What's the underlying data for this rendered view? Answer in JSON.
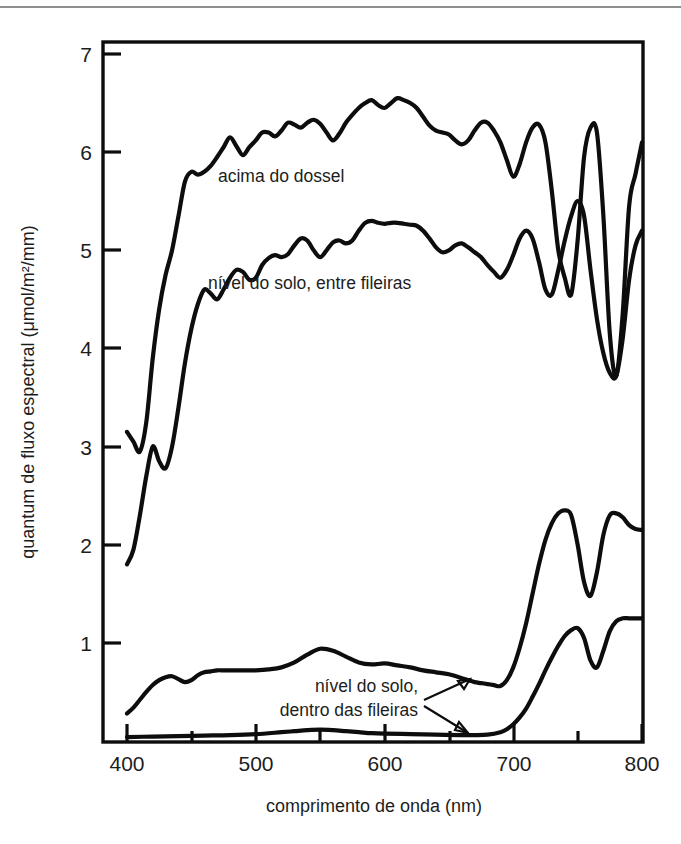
{
  "figure": {
    "divider_color": "#8f8f8f",
    "axes": {
      "x": {
        "label": "comprimento de onda (nm)",
        "ticks": [
          400,
          500,
          600,
          700,
          800
        ],
        "minor_ticks": [
          450,
          550,
          650,
          750
        ],
        "range": [
          395,
          805
        ],
        "unit": "nm"
      },
      "y": {
        "label": "quantum de fluxo espectral (μmol/m²/mm)",
        "label_plain": "quantum de fluxo espectral (umol/m2/mm)",
        "ticks": [
          1,
          2,
          3,
          4,
          5,
          6,
          7
        ],
        "range": [
          0,
          7.55
        ],
        "unit": "μmol/m²/mm"
      }
    },
    "annotations": [
      {
        "id": "acima-do-dossel",
        "text": "acima do dossel",
        "x": 218,
        "y": 182
      },
      {
        "id": "nivel-entre-fileiras",
        "text": "nível do solo, entre fileiras",
        "x": 208,
        "y": 289
      },
      {
        "id": "nivel-dentro-line1",
        "text": "nível do solo,",
        "x": 304,
        "y": 692
      },
      {
        "id": "nivel-dentro-line2",
        "text": "dentro das fileiras",
        "x": 262,
        "y": 716
      }
    ]
  },
  "chart_data": {
    "type": "line",
    "title": "",
    "xlabel": "comprimento de onda (nm)",
    "ylabel": "quantum de fluxo espectral (μmol/m²/mm)",
    "xlim": [
      395,
      805
    ],
    "ylim": [
      0,
      7.55
    ],
    "xticks": [
      400,
      500,
      600,
      700,
      800
    ],
    "yticks": [
      1,
      2,
      3,
      4,
      5,
      6,
      7
    ],
    "grid": false,
    "legend": "inline-annotations",
    "line_color": "#0d0d0d",
    "series": [
      {
        "name": "acima do dossel",
        "label_en": "above canopy",
        "x": [
          400,
          405,
          410,
          415,
          420,
          425,
          430,
          435,
          440,
          445,
          450,
          455,
          460,
          465,
          470,
          475,
          480,
          485,
          490,
          495,
          500,
          505,
          510,
          515,
          520,
          525,
          530,
          535,
          540,
          545,
          550,
          555,
          560,
          565,
          570,
          575,
          580,
          585,
          590,
          595,
          600,
          605,
          610,
          615,
          620,
          625,
          630,
          635,
          640,
          645,
          650,
          655,
          660,
          665,
          670,
          675,
          680,
          685,
          690,
          695,
          700,
          705,
          710,
          715,
          720,
          725,
          730,
          735,
          740,
          745,
          750,
          755,
          760,
          765,
          770,
          775,
          780,
          785,
          790,
          795,
          800
        ],
        "y": [
          3.15,
          3.05,
          2.95,
          3.25,
          3.9,
          4.4,
          4.75,
          5.0,
          5.35,
          5.7,
          5.8,
          5.77,
          5.8,
          5.86,
          5.95,
          6.05,
          6.15,
          6.06,
          5.97,
          6.05,
          6.12,
          6.2,
          6.2,
          6.16,
          6.22,
          6.3,
          6.28,
          6.25,
          6.3,
          6.33,
          6.29,
          6.2,
          6.12,
          6.19,
          6.3,
          6.38,
          6.45,
          6.5,
          6.53,
          6.48,
          6.45,
          6.5,
          6.55,
          6.53,
          6.5,
          6.45,
          6.36,
          6.27,
          6.22,
          6.2,
          6.18,
          6.12,
          6.08,
          6.12,
          6.22,
          6.3,
          6.3,
          6.22,
          6.1,
          5.92,
          5.75,
          5.88,
          6.1,
          6.25,
          6.28,
          6.1,
          5.6,
          5.0,
          4.72,
          4.55,
          5.1,
          5.95,
          6.25,
          6.2,
          5.35,
          4.15,
          3.72,
          4.35,
          5.45,
          5.78,
          6.1
        ]
      },
      {
        "name": "nível do solo, entre fileiras",
        "label_en": "ground level, between rows",
        "x": [
          400,
          405,
          410,
          415,
          420,
          425,
          430,
          435,
          440,
          445,
          450,
          455,
          460,
          465,
          470,
          475,
          480,
          485,
          490,
          495,
          500,
          505,
          510,
          515,
          520,
          525,
          530,
          535,
          540,
          545,
          550,
          555,
          560,
          565,
          570,
          575,
          580,
          585,
          590,
          595,
          600,
          605,
          610,
          615,
          620,
          625,
          630,
          635,
          640,
          645,
          650,
          655,
          660,
          665,
          670,
          675,
          680,
          685,
          690,
          695,
          700,
          705,
          710,
          715,
          720,
          725,
          730,
          735,
          740,
          745,
          750,
          755,
          760,
          765,
          770,
          775,
          780,
          785,
          790,
          795,
          800
        ],
        "y": [
          1.8,
          1.95,
          2.3,
          2.7,
          3.0,
          2.85,
          2.78,
          3.0,
          3.4,
          3.85,
          4.2,
          4.45,
          4.6,
          4.56,
          4.5,
          4.6,
          4.72,
          4.8,
          4.78,
          4.7,
          4.72,
          4.85,
          4.92,
          4.95,
          4.93,
          4.96,
          5.05,
          5.12,
          5.1,
          5.0,
          4.93,
          5.0,
          5.08,
          5.1,
          5.07,
          5.1,
          5.2,
          5.28,
          5.3,
          5.28,
          5.27,
          5.28,
          5.28,
          5.27,
          5.26,
          5.25,
          5.2,
          5.12,
          5.03,
          4.98,
          5.0,
          5.05,
          5.07,
          5.03,
          4.98,
          4.93,
          4.85,
          4.78,
          4.72,
          4.8,
          4.95,
          5.12,
          5.2,
          5.12,
          4.88,
          4.6,
          4.55,
          4.8,
          5.1,
          5.35,
          5.5,
          5.35,
          4.8,
          4.3,
          3.95,
          3.75,
          3.72,
          4.1,
          4.7,
          5.05,
          5.2
        ]
      },
      {
        "name": "nível do solo, dentro das fileiras (superior)",
        "label_en": "ground level, within rows (upper)",
        "x": [
          400,
          405,
          410,
          415,
          420,
          425,
          430,
          435,
          440,
          445,
          450,
          455,
          460,
          465,
          470,
          475,
          480,
          485,
          490,
          495,
          500,
          510,
          520,
          530,
          540,
          550,
          560,
          570,
          580,
          590,
          600,
          610,
          620,
          630,
          640,
          650,
          660,
          665,
          670,
          675,
          680,
          685,
          690,
          695,
          700,
          705,
          710,
          715,
          720,
          725,
          730,
          735,
          740,
          745,
          750,
          755,
          760,
          765,
          770,
          775,
          780,
          785,
          790,
          795,
          800
        ],
        "y": [
          0.28,
          0.34,
          0.42,
          0.5,
          0.57,
          0.62,
          0.65,
          0.66,
          0.63,
          0.6,
          0.62,
          0.67,
          0.7,
          0.71,
          0.72,
          0.72,
          0.72,
          0.72,
          0.72,
          0.72,
          0.72,
          0.73,
          0.75,
          0.8,
          0.88,
          0.94,
          0.92,
          0.86,
          0.8,
          0.78,
          0.79,
          0.77,
          0.75,
          0.72,
          0.7,
          0.68,
          0.64,
          0.62,
          0.6,
          0.59,
          0.58,
          0.57,
          0.56,
          0.62,
          0.75,
          0.95,
          1.2,
          1.5,
          1.8,
          2.05,
          2.22,
          2.32,
          2.35,
          2.3,
          2.0,
          1.62,
          1.48,
          1.72,
          2.1,
          2.3,
          2.32,
          2.28,
          2.2,
          2.16,
          2.15
        ]
      },
      {
        "name": "nível do solo, dentro das fileiras (inferior)",
        "label_en": "ground level, within rows (lower)",
        "x": [
          400,
          420,
          440,
          460,
          480,
          500,
          520,
          530,
          540,
          550,
          560,
          570,
          580,
          590,
          600,
          620,
          640,
          660,
          670,
          680,
          690,
          695,
          700,
          705,
          710,
          715,
          720,
          725,
          730,
          735,
          740,
          745,
          750,
          755,
          760,
          765,
          770,
          775,
          780,
          785,
          790,
          795,
          800
        ],
        "y": [
          0.04,
          0.045,
          0.05,
          0.055,
          0.06,
          0.07,
          0.09,
          0.1,
          0.11,
          0.115,
          0.11,
          0.1,
          0.09,
          0.08,
          0.075,
          0.07,
          0.065,
          0.06,
          0.06,
          0.065,
          0.09,
          0.12,
          0.17,
          0.24,
          0.33,
          0.45,
          0.58,
          0.72,
          0.85,
          0.97,
          1.07,
          1.13,
          1.15,
          1.05,
          0.82,
          0.75,
          0.92,
          1.12,
          1.22,
          1.25,
          1.25,
          1.25,
          1.25
        ]
      }
    ]
  }
}
